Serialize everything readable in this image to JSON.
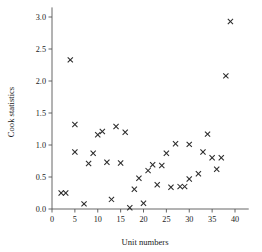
{
  "chart_data": {
    "type": "scatter",
    "title": "",
    "xlabel": "Unit numbers",
    "ylabel": "Cook statistics",
    "xlim": [
      0,
      43
    ],
    "ylim": [
      0,
      3.15
    ],
    "xticks": [
      0,
      5,
      10,
      15,
      20,
      25,
      30,
      35,
      40
    ],
    "xtick_labels": [
      "0",
      "5",
      "10",
      "15",
      "20",
      "25",
      "30",
      "35",
      "40"
    ],
    "yticks": [
      0.0,
      0.5,
      1.0,
      1.5,
      2.0,
      2.5,
      3.0
    ],
    "ytick_labels": [
      "0.0",
      "0.5",
      "1.0",
      "1.5",
      "2.0",
      "2.5",
      "3.0"
    ],
    "grid": false,
    "legend": false,
    "marker": "x",
    "marker_color": "#2b2b2b",
    "points": [
      {
        "x": 2,
        "y": 0.25
      },
      {
        "x": 3,
        "y": 0.25
      },
      {
        "x": 4,
        "y": 2.33
      },
      {
        "x": 5,
        "y": 1.32
      },
      {
        "x": 5,
        "y": 0.89
      },
      {
        "x": 7,
        "y": 0.08
      },
      {
        "x": 8,
        "y": 0.71
      },
      {
        "x": 9,
        "y": 0.87
      },
      {
        "x": 10,
        "y": 1.16
      },
      {
        "x": 11,
        "y": 1.21
      },
      {
        "x": 12,
        "y": 0.73
      },
      {
        "x": 13,
        "y": 0.15
      },
      {
        "x": 14,
        "y": 1.29
      },
      {
        "x": 15,
        "y": 0.72
      },
      {
        "x": 16,
        "y": 1.2
      },
      {
        "x": 17,
        "y": 0.02
      },
      {
        "x": 18,
        "y": 0.31
      },
      {
        "x": 19,
        "y": 0.48
      },
      {
        "x": 20,
        "y": 0.09
      },
      {
        "x": 21,
        "y": 0.6
      },
      {
        "x": 22,
        "y": 0.69
      },
      {
        "x": 23,
        "y": 0.38
      },
      {
        "x": 24,
        "y": 0.68
      },
      {
        "x": 25,
        "y": 0.87
      },
      {
        "x": 26,
        "y": 0.34
      },
      {
        "x": 27,
        "y": 1.02
      },
      {
        "x": 28,
        "y": 0.35
      },
      {
        "x": 29,
        "y": 0.35
      },
      {
        "x": 30,
        "y": 1.01
      },
      {
        "x": 30,
        "y": 0.47
      },
      {
        "x": 32,
        "y": 0.55
      },
      {
        "x": 33,
        "y": 0.89
      },
      {
        "x": 34,
        "y": 1.17
      },
      {
        "x": 35,
        "y": 0.8
      },
      {
        "x": 36,
        "y": 0.62
      },
      {
        "x": 37,
        "y": 0.8
      },
      {
        "x": 38,
        "y": 2.08
      },
      {
        "x": 39,
        "y": 2.93
      }
    ]
  }
}
